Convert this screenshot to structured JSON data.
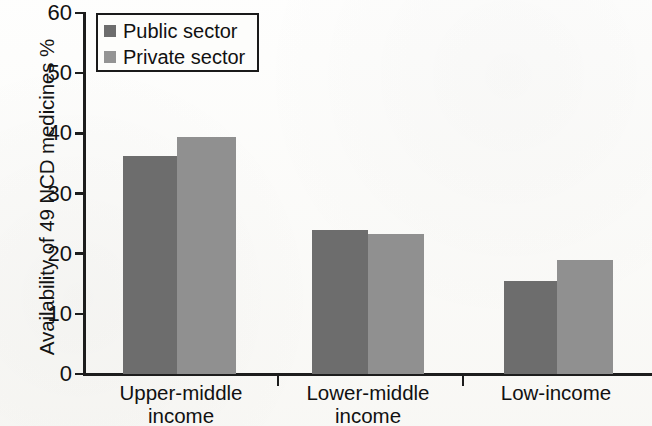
{
  "chart_data": {
    "type": "bar",
    "title": "",
    "xlabel": "",
    "ylabel": "Availability of 49 NCD medicines %",
    "ylim": [
      0,
      60
    ],
    "ytick_labels": [
      "0",
      "10",
      "20",
      "30",
      "40",
      "50",
      "60"
    ],
    "ytick_values": [
      0,
      10,
      20,
      30,
      40,
      50,
      60
    ],
    "grid": false,
    "legend_position": "top-left",
    "categories": [
      "Upper-middle\nincome",
      "Lower-middle\nincome",
      "Low-income"
    ],
    "series": [
      {
        "name": "Public sector",
        "color": "#6d6d6d",
        "values": [
          36.2,
          24.0,
          15.4
        ]
      },
      {
        "name": "Private sector",
        "color": "#909090",
        "values": [
          39.4,
          23.3,
          19.0
        ]
      }
    ]
  },
  "legend": {
    "items": [
      {
        "label": "Public sector",
        "swatch": "public"
      },
      {
        "label": "Private sector",
        "swatch": "private"
      }
    ]
  }
}
